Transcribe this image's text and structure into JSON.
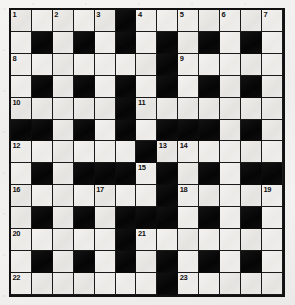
{
  "page": {
    "paper_color": "#f1f0ee",
    "ink_color": "#111111",
    "block_color": "#0b0b0b",
    "grid_line_color": "#1a1a1a"
  },
  "crossword": {
    "rows": 13,
    "cols": 13,
    "cell_size_px": 21,
    "symmetry": "180-degree rotational",
    "legend": {
      "white": "open letter cell",
      "black": "blocked cell"
    },
    "numbers_total": 23,
    "grid": [
      [
        "W1",
        "W",
        "W2",
        "W",
        "W3",
        "B",
        "W4",
        "W",
        "W5",
        "W",
        "W6",
        "W",
        "W7"
      ],
      [
        "W",
        "B",
        "W",
        "B",
        "W",
        "B",
        "W",
        "B",
        "W",
        "B",
        "W",
        "B",
        "W"
      ],
      [
        "W8",
        "W",
        "W",
        "W",
        "W",
        "W",
        "W",
        "B",
        "W9",
        "W",
        "W",
        "W",
        "W"
      ],
      [
        "W",
        "B",
        "W",
        "B",
        "W",
        "B",
        "W",
        "B",
        "W",
        "B",
        "W",
        "B",
        "W"
      ],
      [
        "W10",
        "W",
        "W",
        "W",
        "W",
        "B",
        "W11",
        "W",
        "W",
        "W",
        "W",
        "W",
        "W"
      ],
      [
        "B",
        "B",
        "W",
        "B",
        "W",
        "B",
        "W",
        "B",
        "B",
        "B",
        "W",
        "B",
        "W"
      ],
      [
        "W12",
        "W",
        "W",
        "W",
        "W",
        "W",
        "B",
        "W13",
        "W14",
        "W",
        "W",
        "W",
        "W"
      ],
      [
        "W",
        "B",
        "W",
        "B",
        "B",
        "B",
        "W15",
        "B",
        "W",
        "B",
        "W",
        "B",
        "B"
      ],
      [
        "W16",
        "W",
        "W",
        "W",
        "W17",
        "W",
        "W",
        "B",
        "W18",
        "W",
        "W",
        "W",
        "W19"
      ],
      [
        "W",
        "B",
        "W",
        "B",
        "W",
        "B",
        "B",
        "B",
        "W",
        "B",
        "W",
        "B",
        "W"
      ],
      [
        "W20",
        "W",
        "W",
        "W",
        "W",
        "B",
        "W21",
        "W",
        "W",
        "W",
        "W",
        "W",
        "W"
      ],
      [
        "W",
        "B",
        "W",
        "B",
        "W",
        "B",
        "W",
        "B",
        "W",
        "B",
        "W",
        "B",
        "W"
      ],
      [
        "W22",
        "W",
        "W",
        "W",
        "W",
        "W",
        "W",
        "B",
        "W23",
        "W",
        "W",
        "W",
        "W"
      ]
    ],
    "clue_numbers": [
      {
        "n": 1,
        "row": 0,
        "col": 0
      },
      {
        "n": 2,
        "row": 0,
        "col": 2
      },
      {
        "n": 3,
        "row": 0,
        "col": 4
      },
      {
        "n": 4,
        "row": 0,
        "col": 6
      },
      {
        "n": 5,
        "row": 0,
        "col": 8
      },
      {
        "n": 6,
        "row": 0,
        "col": 10
      },
      {
        "n": 7,
        "row": 0,
        "col": 12
      },
      {
        "n": 8,
        "row": 2,
        "col": 0
      },
      {
        "n": 9,
        "row": 2,
        "col": 8
      },
      {
        "n": 10,
        "row": 4,
        "col": 0
      },
      {
        "n": 11,
        "row": 4,
        "col": 6
      },
      {
        "n": 12,
        "row": 6,
        "col": 0
      },
      {
        "n": 13,
        "row": 6,
        "col": 7
      },
      {
        "n": 14,
        "row": 6,
        "col": 8
      },
      {
        "n": 15,
        "row": 7,
        "col": 6
      },
      {
        "n": 16,
        "row": 8,
        "col": 0
      },
      {
        "n": 17,
        "row": 8,
        "col": 4
      },
      {
        "n": 18,
        "row": 8,
        "col": 8
      },
      {
        "n": 19,
        "row": 8,
        "col": 12
      },
      {
        "n": 20,
        "row": 10,
        "col": 0
      },
      {
        "n": 21,
        "row": 10,
        "col": 6
      },
      {
        "n": 22,
        "row": 12,
        "col": 0
      },
      {
        "n": 23,
        "row": 12,
        "col": 8
      }
    ]
  }
}
